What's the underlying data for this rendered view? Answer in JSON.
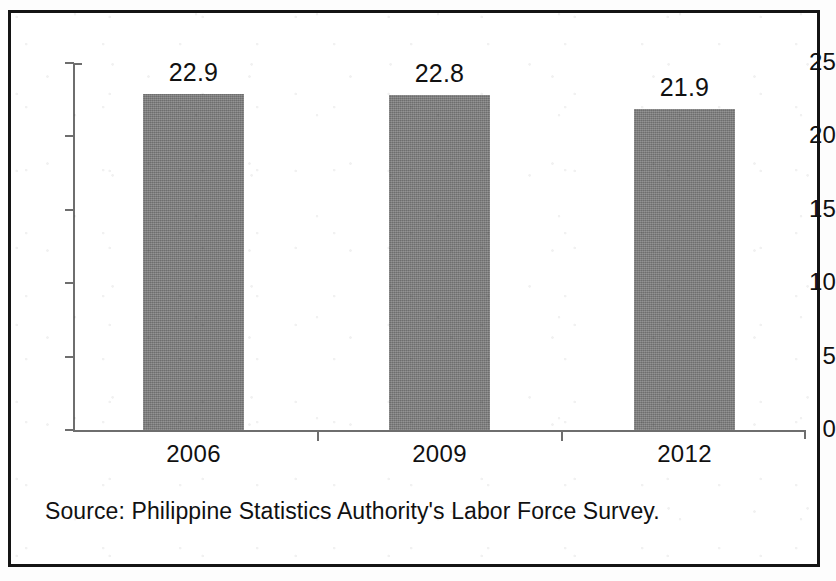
{
  "figure": {
    "border_color": "#141414",
    "background_color": "#ffffff",
    "source_note": "Source: Philippine Statistics Authority's Labor Force Survey."
  },
  "chart_data": {
    "type": "bar",
    "title": "",
    "subtitle": "",
    "xlabel": "",
    "ylabel": "",
    "categories": [
      "2006",
      "2009",
      "2012"
    ],
    "values": [
      22.9,
      22.8,
      21.9
    ],
    "data_labels": [
      "22.9",
      "22.8",
      "21.9"
    ],
    "ylim": [
      0,
      25
    ],
    "y_ticks": [
      0,
      5,
      10,
      15,
      20,
      25
    ],
    "y_tick_labels": [
      "0",
      "5",
      "10",
      "15",
      "20",
      "25"
    ],
    "grid": false,
    "legend": null,
    "bar_color": "#7d7d7d",
    "axis_color": "#6e6e6e",
    "text_color": "#111111"
  }
}
